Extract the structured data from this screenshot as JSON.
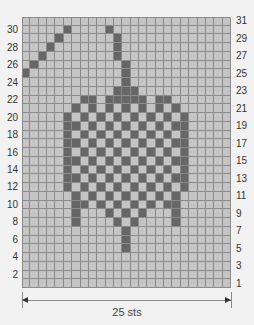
{
  "chart": {
    "stitch_count_label": "25 sts",
    "cols": 25,
    "rows": 31,
    "colors": {
      "background": "#c4c4c4",
      "contrast": "#666666",
      "grid": "#8a8a8a"
    },
    "left_row_labels": [
      "2",
      "4",
      "6",
      "8",
      "10",
      "12",
      "14",
      "16",
      "18",
      "20",
      "22",
      "24",
      "26",
      "28",
      "30"
    ],
    "right_row_labels": [
      "1",
      "3",
      "5",
      "7",
      "9",
      "11",
      "13",
      "15",
      "17",
      "19",
      "21",
      "23",
      "25",
      "27",
      "29",
      "31"
    ]
  },
  "chart_data": {
    "type": "heatmap",
    "title": "",
    "xlabel": "25 sts",
    "ylabel": "",
    "cols": 25,
    "rows": 31,
    "dark_cells_by_row": {
      "30": [
        6,
        11
      ],
      "29": [
        5,
        12
      ],
      "28": [
        4,
        12
      ],
      "27": [
        3,
        12
      ],
      "26": [
        2,
        13
      ],
      "25": [
        1,
        13
      ],
      "24": [
        13
      ],
      "23": [
        12,
        13,
        14
      ],
      "22": [
        8,
        9,
        11,
        12,
        13,
        14,
        15,
        17,
        18
      ],
      "21": [
        7,
        9,
        11,
        13,
        15,
        17,
        19
      ],
      "20": [
        6,
        8,
        10,
        12,
        14,
        16,
        18,
        20
      ],
      "19": [
        6,
        7,
        9,
        11,
        13,
        15,
        17,
        19,
        20
      ],
      "18": [
        6,
        8,
        10,
        12,
        14,
        16,
        18,
        20
      ],
      "17": [
        6,
        7,
        9,
        11,
        13,
        15,
        17,
        19,
        20
      ],
      "16": [
        6,
        8,
        10,
        12,
        14,
        16,
        18,
        20
      ],
      "15": [
        6,
        7,
        9,
        11,
        13,
        15,
        17,
        19,
        20
      ],
      "14": [
        6,
        8,
        10,
        12,
        14,
        16,
        18,
        20
      ],
      "13": [
        6,
        7,
        9,
        11,
        13,
        15,
        17,
        19,
        20
      ],
      "12": [
        6,
        8,
        10,
        12,
        14,
        16,
        18,
        20
      ],
      "11": [
        7,
        9,
        11,
        13,
        15,
        17,
        19
      ],
      "10": [
        7,
        8,
        10,
        12,
        14,
        16,
        18,
        19
      ],
      "9": [
        7,
        11,
        13,
        15,
        19
      ],
      "8": [
        7,
        12,
        14,
        19
      ],
      "7": [
        13
      ],
      "6": [
        13
      ],
      "5": [
        13
      ]
    }
  }
}
